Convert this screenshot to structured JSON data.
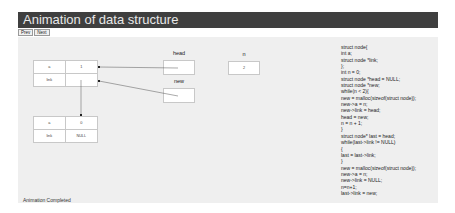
{
  "header": {
    "title": "Animation of data structure",
    "bg_color": "#3f3f3f"
  },
  "controls": {
    "prev_label": "Prev",
    "next_label": "Next"
  },
  "nodes": [
    {
      "data_label": "a",
      "data_value": "1",
      "link_label": "link",
      "link_value": ""
    },
    {
      "data_label": "a",
      "data_value": "0",
      "link_label": "link",
      "link_value": "NULL"
    }
  ],
  "variables": {
    "head": {
      "label": "head",
      "value": ""
    },
    "new": {
      "label": "new",
      "value": ""
    },
    "n": {
      "label": "n",
      "value": "2"
    }
  },
  "code": {
    "lines": [
      "struct node{",
      "int a;",
      "struct node *link;",
      "};",
      "int n = 0;",
      "struct node *head = NULL;",
      "struct node *new;",
      "while(n < 2){",
      "new = malloc(sizeof(struct node));",
      "new->a = n;",
      "new->link = head;",
      "head = new;",
      "n = n + 1;",
      "}",
      "struct node* last = head;",
      "while(last->link != NULL)",
      "{",
      "last = last->link;",
      "}",
      "new = malloc(sizeof(struct node));",
      "new->a = n;",
      "new->link = NULL;",
      "n=n+1;",
      "last->link = new;"
    ]
  },
  "status": {
    "text": "Animation Completed"
  }
}
